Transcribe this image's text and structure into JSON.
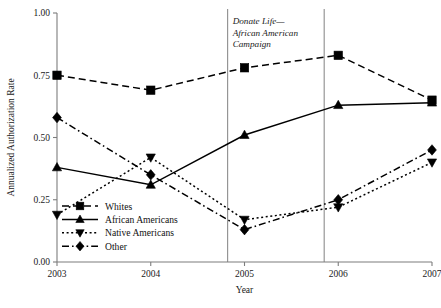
{
  "chart_data": {
    "type": "line",
    "title": "",
    "xlabel": "Year",
    "ylabel": "Annualized Authorization Rate",
    "x": [
      "2003",
      "2004",
      "2005",
      "2006",
      "2007"
    ],
    "categories": [
      "2003",
      "2004",
      "2005",
      "2006",
      "2007"
    ],
    "xlim": [
      2003,
      2007
    ],
    "ylim": [
      0.0,
      1.0
    ],
    "yticks": [
      "0.00",
      "0.25",
      "0.50",
      "0.75",
      "1.00"
    ],
    "ytick_values": [
      0.0,
      0.25,
      0.5,
      0.75,
      1.0
    ],
    "xticks": [
      "2003",
      "2004",
      "2005",
      "2006",
      "2007"
    ],
    "grid": false,
    "legend_position": "lower-left-inside",
    "series": [
      {
        "name": "Whites",
        "marker": "square",
        "linestyle": "dashed",
        "color": "#000000",
        "values": [
          0.75,
          0.69,
          0.78,
          0.83,
          0.65
        ]
      },
      {
        "name": "African Americans",
        "marker": "triangle-up",
        "linestyle": "solid",
        "color": "#000000",
        "values": [
          0.38,
          0.31,
          0.51,
          0.63,
          0.64
        ]
      },
      {
        "name": "Native Americans",
        "marker": "triangle-down",
        "linestyle": "dotted",
        "color": "#000000",
        "values": [
          0.19,
          0.42,
          0.17,
          0.22,
          0.4
        ]
      },
      {
        "name": "Other",
        "marker": "diamond",
        "linestyle": "dash-dot",
        "color": "#000000",
        "values": [
          0.58,
          0.35,
          0.13,
          0.25,
          0.45
        ]
      }
    ],
    "annotations": [
      {
        "text_lines": [
          "Donate Life—",
          "African American",
          "Campaign"
        ],
        "style": "italic",
        "span_start_x": 2004.82,
        "span_end_x": 2005.85
      }
    ],
    "vertical_markers": [
      2004.82,
      2005.85
    ]
  },
  "legend": {
    "entries": [
      {
        "label": "Whites"
      },
      {
        "label": "African Americans"
      },
      {
        "label": "Native Americans"
      },
      {
        "label": "Other"
      }
    ]
  }
}
